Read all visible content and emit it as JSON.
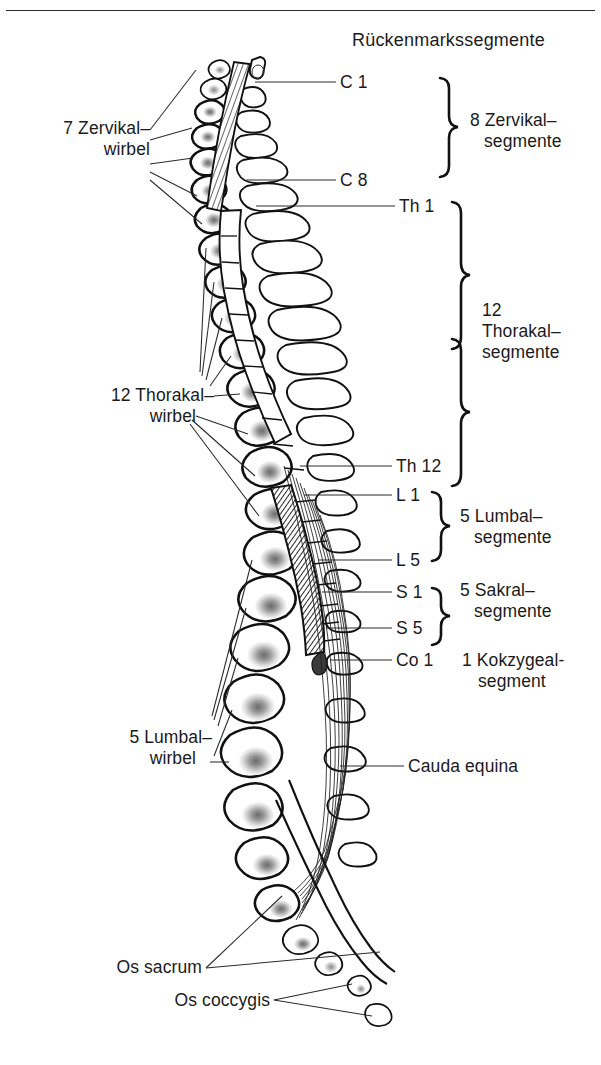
{
  "figure": {
    "title": "Rückenmarkssegmente",
    "background_color": "#ffffff",
    "ink_color": "#1b1b1b",
    "has_top_rule": true
  },
  "labels_right": {
    "c1": "C 1",
    "c8": "C 8",
    "th1": "Th 1",
    "th12": "Th 12",
    "l1": "L 1",
    "l5": "L 5",
    "s1": "S 1",
    "s5": "S 5",
    "co1": "Co 1",
    "cauda_equina": "Cauda equina"
  },
  "segment_groups": [
    {
      "id": "cervical",
      "line1": "8 Zervikal–",
      "line2": "segmente"
    },
    {
      "id": "thoracic",
      "line1": "12",
      "line2": "Thorakal–",
      "line3": "segmente"
    },
    {
      "id": "lumbar",
      "line1": "5 Lumbal–",
      "line2": "segmente"
    },
    {
      "id": "sacral",
      "line1": "5 Sakral–",
      "line2": "segmente"
    },
    {
      "id": "coccygeal",
      "line1": "1 Kokzygeal-",
      "line2": "segment"
    }
  ],
  "labels_left": {
    "cervical_vertebrae_l1": "7 Zervikal–",
    "cervical_vertebrae_l2": "wirbel",
    "thoracic_vertebrae_l1": "12 Thorakal–",
    "thoracic_vertebrae_l2": "wirbel",
    "lumbar_vertebrae_l1": "5 Lumbal–",
    "lumbar_vertebrae_l2": "wirbel",
    "os_sacrum": "Os sacrum",
    "os_coccygis": "Os coccygis"
  }
}
